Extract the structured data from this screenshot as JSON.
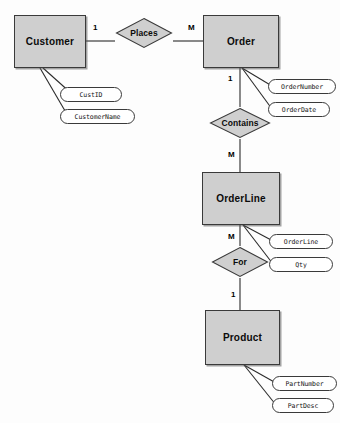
{
  "diagram": {
    "notation": "chen",
    "background_color": "#fdfdfd",
    "entity_fill": "#cfcfcf",
    "entity_stroke": "#3a3a3a",
    "attribute_fill": "#ffffff",
    "line_color": "#2b2b2b"
  },
  "entities": [
    {
      "id": "customer",
      "label": "Customer",
      "x": 14,
      "y": 15,
      "w": 72,
      "h": 53
    },
    {
      "id": "order",
      "label": "Order",
      "x": 203,
      "y": 15,
      "w": 76,
      "h": 53
    },
    {
      "id": "orderline",
      "label": "OrderLine",
      "x": 202,
      "y": 172,
      "w": 78,
      "h": 53
    },
    {
      "id": "product",
      "label": "Product",
      "x": 205,
      "y": 310,
      "w": 75,
      "h": 55
    }
  ],
  "relationships": [
    {
      "id": "places",
      "label": "Places",
      "cx": 144,
      "cy": 33,
      "w": 58,
      "h": 32,
      "from": "customer",
      "to": "order",
      "from_card": "1",
      "to_card": "M"
    },
    {
      "id": "contains",
      "label": "Contains",
      "cx": 240,
      "cy": 123,
      "w": 62,
      "h": 32,
      "from": "order",
      "to": "orderline",
      "from_card": "1",
      "to_card": "M"
    },
    {
      "id": "for",
      "label": "For",
      "cx": 240,
      "cy": 262,
      "w": 58,
      "h": 32,
      "from": "orderline",
      "to": "product",
      "from_card": "M",
      "to_card": "1"
    }
  ],
  "attributes": [
    {
      "id": "custid",
      "label": "CustID",
      "owner": "customer",
      "x": 60,
      "y": 87,
      "w": 62,
      "h": 15
    },
    {
      "id": "customername",
      "label": "CustomerName",
      "owner": "customer",
      "x": 60,
      "y": 109,
      "w": 75,
      "h": 15
    },
    {
      "id": "ordernumber",
      "label": "OrderNumber",
      "owner": "order",
      "x": 268,
      "y": 79,
      "w": 68,
      "h": 15
    },
    {
      "id": "orderdate",
      "label": "OrderDate",
      "owner": "order",
      "x": 268,
      "y": 102,
      "w": 62,
      "h": 15
    },
    {
      "id": "orderlineattr",
      "label": "OrderLine",
      "owner": "orderline",
      "x": 269,
      "y": 234,
      "w": 64,
      "h": 15
    },
    {
      "id": "qty",
      "label": "Qty",
      "owner": "orderline",
      "x": 269,
      "y": 257,
      "w": 64,
      "h": 15
    },
    {
      "id": "partnumber",
      "label": "PartNumber",
      "owner": "product",
      "x": 272,
      "y": 376,
      "w": 65,
      "h": 15
    },
    {
      "id": "partdesc",
      "label": "PartDesc",
      "owner": "product",
      "x": 272,
      "y": 398,
      "w": 62,
      "h": 15
    }
  ],
  "cardinality_markers": [
    {
      "id": "card-customer-places",
      "value": "1",
      "x": 93,
      "y": 23
    },
    {
      "id": "card-places-order",
      "value": "M",
      "x": 188,
      "y": 23
    },
    {
      "id": "card-order-contains",
      "value": "1",
      "x": 228,
      "y": 74
    },
    {
      "id": "card-contains-orderline",
      "value": "M",
      "x": 228,
      "y": 150
    },
    {
      "id": "card-orderline-for",
      "value": "M",
      "x": 228,
      "y": 232
    },
    {
      "id": "card-for-product",
      "value": "1",
      "x": 231,
      "y": 290
    }
  ]
}
